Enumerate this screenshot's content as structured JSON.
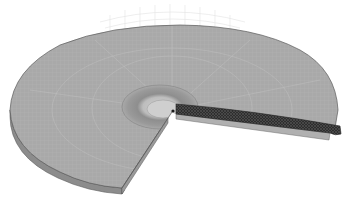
{
  "figure": {
    "kind": "3D finite element mesh of a cracked circular disc",
    "background": "#ffffff",
    "colors": {
      "disc_top": "#a9a9a9",
      "disc_side": "#8c8c8c",
      "disc_edge_line": "#5a5a5a",
      "mesh_line": "#bdbdbd",
      "ghost_mesh": "#e4e4e4",
      "refined_ring": "#8f8f8f",
      "inner_core": "#c8c8c8",
      "crack_mesh": "#2a2a2a",
      "crack_face": "#b0b0b0"
    },
    "labels": []
  }
}
